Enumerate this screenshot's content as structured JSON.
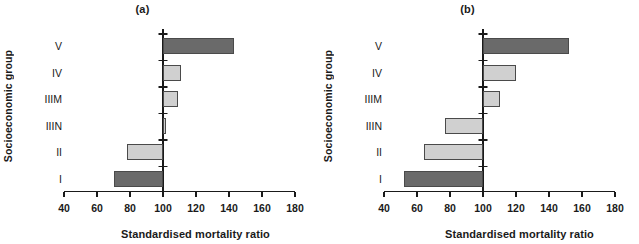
{
  "figure": {
    "ylabel": "Socioeconomic group",
    "xlabel": "Standardised mortality ratio",
    "colors": {
      "dark_bar": "#6a6a6a",
      "light_bar": "#d0d0d0",
      "axis": "#1a1a1a",
      "background": "#ffffff"
    }
  },
  "chart_data": [
    {
      "type": "bar",
      "title": "(a)",
      "orientation": "horizontal",
      "baseline": 100,
      "categories": [
        "I",
        "II",
        "IIIN",
        "IIIM",
        "IV",
        "V"
      ],
      "values": [
        70,
        78,
        102,
        109,
        111,
        143
      ],
      "bar_colors": [
        "#6a6a6a",
        "#d0d0d0",
        "#d0d0d0",
        "#d0d0d0",
        "#d0d0d0",
        "#6a6a6a"
      ],
      "xlabel": "Standardised mortality ratio",
      "ylabel": "Socioeconomic group",
      "xlim": [
        40,
        180
      ],
      "xticks": [
        40,
        60,
        80,
        100,
        120,
        140,
        160,
        180
      ],
      "xticklabels": [
        "40",
        "60",
        "80",
        "100",
        "120",
        "140",
        "160",
        "180"
      ],
      "grid": false,
      "legend": "none"
    },
    {
      "type": "bar",
      "title": "(b)",
      "orientation": "horizontal",
      "baseline": 100,
      "categories": [
        "I",
        "II",
        "IIIN",
        "IIIM",
        "IV",
        "V"
      ],
      "values": [
        52,
        64,
        77,
        110,
        120,
        152
      ],
      "bar_colors": [
        "#6a6a6a",
        "#d0d0d0",
        "#d0d0d0",
        "#d0d0d0",
        "#d0d0d0",
        "#6a6a6a"
      ],
      "xlabel": "Standardised mortality ratio",
      "ylabel": "Socioeconomic group",
      "xlim": [
        40,
        180
      ],
      "xticks": [
        40,
        60,
        80,
        100,
        120,
        140,
        160,
        180
      ],
      "xticklabels": [
        "40",
        "60",
        "80",
        "100",
        "120",
        "140",
        "160",
        "180"
      ],
      "grid": false,
      "legend": "none"
    }
  ]
}
